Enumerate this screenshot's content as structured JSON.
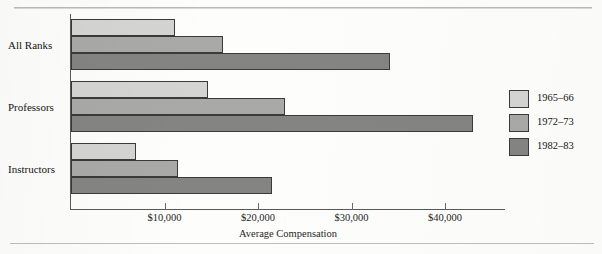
{
  "decorations": {
    "top_caption_fragment": "",
    "top_rule": "hairline-rule",
    "bottom_rule": "hairline-rule"
  },
  "legend": {
    "position": "right",
    "entries": [
      {
        "label": "1965–66",
        "color": "#d4d4d2"
      },
      {
        "label": "1972–73",
        "color": "#a9a9a7"
      },
      {
        "label": "1982–83",
        "color": "#848482"
      }
    ]
  },
  "chart_data": {
    "type": "bar",
    "orientation": "horizontal",
    "title": "",
    "xlabel": "Average Compensation",
    "ylabel": "",
    "categories": [
      "All Ranks",
      "Professors",
      "Instructors"
    ],
    "series": [
      {
        "name": "1965–66",
        "color": "#d4d4d2",
        "values": [
          11100,
          14700,
          6950
        ]
      },
      {
        "name": "1972–73",
        "color": "#a9a9a7",
        "values": [
          16300,
          22900,
          11400
        ]
      },
      {
        "name": "1982–83",
        "color": "#848482",
        "values": [
          34100,
          43000,
          21500
        ]
      }
    ],
    "xlim": [
      0,
      46500
    ],
    "xticks": [
      10000,
      20000,
      30000,
      40000
    ],
    "xtick_labels": [
      "$10,000",
      "$20,000",
      "$30,000",
      "$40,000"
    ],
    "grid": false,
    "legend_position": "right"
  }
}
